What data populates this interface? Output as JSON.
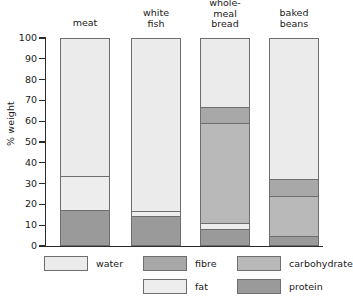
{
  "chart_data": {
    "type": "bar",
    "stacked": true,
    "title": "",
    "subtitle": "",
    "xlabel": "",
    "ylabel": "% weight",
    "ylim": [
      0,
      100
    ],
    "yticks": [
      0,
      10,
      20,
      30,
      40,
      50,
      60,
      70,
      80,
      90,
      100
    ],
    "ytick_labels": [
      "0",
      "10",
      "20",
      "30",
      "40",
      "50",
      "60",
      "70",
      "80",
      "90",
      "100"
    ],
    "grid": false,
    "legend_position": "bottom",
    "categories": [
      "meat",
      "white\nfish",
      "whole-\nmeal\nbread",
      "baked\nbeans"
    ],
    "category_labels": [
      "meat",
      "white fish",
      "whole-meal bread",
      "baked beans"
    ],
    "stack_order_bottom_to_top": [
      "protein",
      "fat",
      "carbohydrate",
      "fibre",
      "water"
    ],
    "series": [
      {
        "name": "protein",
        "color": "#9a9a9a",
        "values": [
          18.0,
          15.0,
          8.7,
          5.3
        ]
      },
      {
        "name": "fat",
        "color": "#ededed",
        "values": [
          16.0,
          2.5,
          3.0,
          0.0
        ]
      },
      {
        "name": "carbohydrate",
        "color": "#b9b9b9",
        "values": [
          0.0,
          0.0,
          47.8,
          19.2
        ]
      },
      {
        "name": "fibre",
        "color": "#a8a8a8",
        "values": [
          0.0,
          0.0,
          8.0,
          8.0
        ]
      },
      {
        "name": "water",
        "color": "#ebebeb",
        "values": [
          66.0,
          82.5,
          32.5,
          67.5
        ]
      }
    ],
    "cumulative_boundaries": {
      "meat": [
        18.0,
        34.0,
        34.0,
        34.0,
        100.0
      ],
      "white fish": [
        15.0,
        17.5,
        17.5,
        17.5,
        100.0
      ],
      "whole-meal bread": [
        8.7,
        11.7,
        59.5,
        67.5,
        100.0
      ],
      "baked beans": [
        5.3,
        5.3,
        24.5,
        32.5,
        100.0
      ]
    }
  },
  "legend": {
    "rows": [
      [
        {
          "label": "water",
          "swatch": "#ebebeb"
        },
        {
          "label": "fibre",
          "swatch": "#a8a8a8"
        },
        {
          "label": "carbohydrate",
          "swatch": "#b9b9b9"
        }
      ],
      [
        {
          "label": "fat",
          "swatch": "#ededed"
        },
        {
          "label": "protein",
          "swatch": "#9a9a9a"
        }
      ]
    ]
  },
  "style": {
    "axis_color": "#2b2b2b",
    "bar_outline": "#6e6e6e",
    "background": "#ffffff",
    "text_color": "#1a1a1a"
  }
}
